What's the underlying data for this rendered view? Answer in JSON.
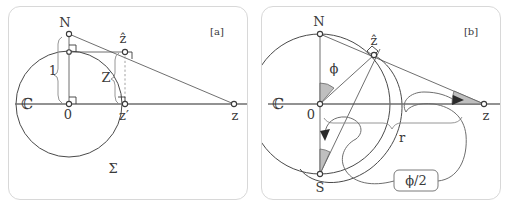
{
  "figure": {
    "caption_tags": [
      "[a]",
      "[b]"
    ],
    "colors": {
      "ink": "#3a3a3a",
      "axis": "#6e6e6e",
      "panel_border": "#d8d8d8",
      "sector_fill": "#b4b4b4",
      "background": "#ffffff"
    }
  },
  "panel_a": {
    "tag": "[a]",
    "labels": {
      "north_pole": "N",
      "origin": "0",
      "plane": "ℂ",
      "sphere": "Σ",
      "z_hat": "ẑ",
      "z_prime": "z′",
      "z": "z",
      "unit_brace": "1",
      "height_brace": "Z"
    },
    "points": {
      "N": {
        "x": 60,
        "y": 27,
        "label": "N"
      },
      "O": {
        "x": 60,
        "y": 97,
        "label": "0"
      },
      "z_hat": {
        "x": 116,
        "y": 45,
        "label": "ẑ"
      },
      "z_prime": {
        "x": 116,
        "y": 97,
        "label": "z′"
      },
      "z": {
        "x": 225,
        "y": 97,
        "label": "z"
      },
      "foot_N": {
        "x": 60,
        "y": 45,
        "label": ""
      }
    },
    "circle": {
      "cx": 60,
      "cy": 97,
      "r": 53
    },
    "axis": {
      "x1": 6,
      "y": 97,
      "x2": 238
    },
    "segments": [
      {
        "name": "ray-N-to-z",
        "from": "N",
        "to": "z"
      },
      {
        "name": "axis-real",
        "from": "left-edge",
        "to": "right-edge"
      },
      {
        "name": "vertical-N-to-O",
        "from": "N",
        "to": "O"
      },
      {
        "name": "horizontal-footN-to-zhat",
        "from": "foot_N",
        "to": "z_hat"
      },
      {
        "name": "vertical-zhat-to-zprime",
        "from": "z_hat",
        "to": "z_prime"
      }
    ]
  },
  "panel_b": {
    "tag": "[b]",
    "labels": {
      "north_pole": "N",
      "south_pole": "S",
      "origin": "0",
      "plane": "ℂ",
      "z_hat": "ẑ",
      "z": "z",
      "phi": "ϕ",
      "radius_brace": "r",
      "half_angle_box": "ϕ/2"
    },
    "points": {
      "N": {
        "x": 58,
        "y": 27,
        "label": "N"
      },
      "S": {
        "x": 58,
        "y": 167,
        "label": "S"
      },
      "O": {
        "x": 58,
        "y": 97,
        "label": "0"
      },
      "z_hat": {
        "x": 112,
        "y": 48,
        "label": "ẑ"
      },
      "z": {
        "x": 222,
        "y": 97,
        "label": "z"
      }
    },
    "circle": {
      "cx": 58,
      "cy": 97,
      "r": 70
    },
    "axis": {
      "x1": 6,
      "y": 97,
      "x2": 238
    },
    "angles": [
      {
        "name": "phi-at-origin",
        "vertex": "O",
        "label": "ϕ",
        "shaded": true
      },
      {
        "name": "half-phi-at-south",
        "vertex": "S",
        "label": "ϕ/2",
        "shaded": true
      },
      {
        "name": "half-phi-at-z",
        "vertex": "z",
        "label": "ϕ/2",
        "shaded": true
      }
    ],
    "segments": [
      {
        "name": "ray-N-to-z",
        "from": "N",
        "to": "z"
      },
      {
        "name": "axis-real",
        "from": "left-edge",
        "to": "right-edge"
      },
      {
        "name": "vertical-N-to-S",
        "from": "N",
        "to": "S"
      },
      {
        "name": "radius-O-to-zhat",
        "from": "O",
        "to": "z_hat"
      },
      {
        "name": "chord-S-to-zhat",
        "from": "S",
        "to": "z_hat"
      }
    ]
  }
}
